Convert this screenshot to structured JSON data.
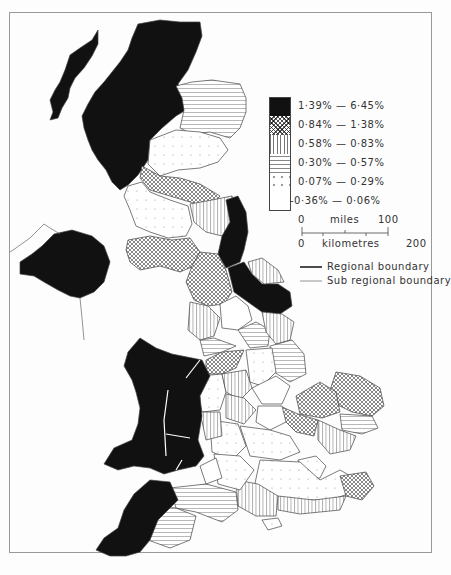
{
  "map": {
    "type": "choropleth",
    "subject": "United Kingdom regions and sub-regions",
    "legend": {
      "classes": [
        {
          "label": "1·39% — 6·45%",
          "pattern": "solid-black"
        },
        {
          "label": "0·84% — 1·38%",
          "pattern": "crosshatch"
        },
        {
          "label": "0·58% — 0·83%",
          "pattern": "vertical-lines"
        },
        {
          "label": "0·30% — 0·57%",
          "pattern": "horizontal-lines"
        },
        {
          "label": "0·07% — 0·29%",
          "pattern": "dots"
        },
        {
          "label": "-0·36% — 0·06%",
          "pattern": "blank"
        }
      ]
    },
    "scale_bar": {
      "miles_label": "miles",
      "miles_start": "0",
      "miles_end": "100",
      "km_label": "kilometres",
      "km_start": "0",
      "km_end": "200"
    },
    "boundary_key": {
      "regional": "Regional boundary",
      "sub_regional": "Sub regional boundary"
    }
  },
  "colors": {
    "ink": "#111111",
    "paper": "#fdfdfd",
    "frame": "#999999"
  }
}
